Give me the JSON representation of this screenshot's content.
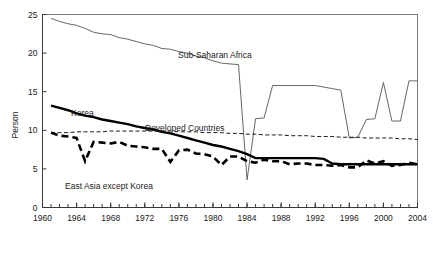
{
  "chart_data": {
    "type": "line",
    "title": "",
    "xlabel": "",
    "ylabel": "Person",
    "xlim": [
      1960,
      2004
    ],
    "ylim": [
      0,
      25
    ],
    "grid": false,
    "legend_position": "inline-annotations",
    "x_tick_labels": [
      "1960",
      "1964",
      "1968",
      "1972",
      "1976",
      "1980",
      "1984",
      "1988",
      "1992",
      "1996",
      "2000",
      "2004"
    ],
    "x_tick_values": [
      1960,
      1964,
      1968,
      1972,
      1976,
      1980,
      1984,
      1988,
      1992,
      1996,
      2000,
      2004
    ],
    "x_minor_tick_step": 1,
    "y_tick_labels": [
      "0",
      "5",
      "10",
      "15",
      "20",
      "25"
    ],
    "y_tick_values": [
      0,
      5,
      10,
      15,
      20,
      25
    ],
    "x": [
      1961,
      1962,
      1963,
      1964,
      1965,
      1966,
      1967,
      1968,
      1969,
      1970,
      1971,
      1972,
      1973,
      1974,
      1975,
      1976,
      1977,
      1978,
      1979,
      1980,
      1981,
      1982,
      1983,
      1984,
      1985,
      1986,
      1987,
      1988,
      1989,
      1990,
      1991,
      1992,
      1993,
      1994,
      1995,
      1996,
      1997,
      1998,
      1999,
      2000,
      2001,
      2002,
      2003,
      2004
    ],
    "series": [
      {
        "name": "Sub-Saharan Africa",
        "style": "thin-solid",
        "color": "#555555",
        "annotation": "Sub-Saharan Africa",
        "values": [
          24.5,
          24.1,
          23.8,
          23.6,
          23.2,
          22.7,
          22.5,
          22.4,
          22.0,
          21.8,
          21.5,
          21.2,
          21.0,
          20.6,
          20.5,
          20.2,
          20.0,
          19.6,
          19.4,
          19.0,
          18.7,
          18.6,
          18.5,
          3.6,
          11.5,
          11.6,
          15.8,
          15.8,
          15.8,
          15.8,
          15.8,
          15.8,
          15.6,
          15.4,
          15.2,
          9.0,
          9.1,
          11.4,
          11.5,
          16.2,
          11.2,
          11.2,
          16.4,
          16.4
        ]
      },
      {
        "name": "Korea",
        "style": "thick-solid",
        "color": "#000000",
        "annotation": "Korea",
        "values": [
          13.2,
          12.9,
          12.6,
          12.2,
          11.9,
          11.7,
          11.4,
          11.2,
          11.0,
          10.8,
          10.5,
          10.3,
          10.1,
          9.8,
          9.6,
          9.3,
          9.0,
          8.7,
          8.4,
          8.1,
          7.9,
          7.6,
          7.3,
          6.9,
          6.4,
          6.4,
          6.4,
          6.4,
          6.4,
          6.4,
          6.4,
          6.4,
          6.3,
          5.7,
          5.6,
          5.6,
          5.6,
          5.6,
          5.6,
          5.6,
          5.6,
          5.6,
          5.6,
          5.6
        ]
      },
      {
        "name": "Developed Countries",
        "style": "thin-dashed",
        "color": "#1a1a1a",
        "annotation": "Developed Countries",
        "values": [
          9.7,
          9.7,
          9.7,
          9.8,
          9.8,
          9.8,
          9.8,
          9.9,
          9.9,
          9.9,
          9.9,
          9.9,
          9.9,
          9.9,
          9.9,
          9.8,
          9.8,
          9.8,
          9.7,
          9.7,
          9.7,
          9.6,
          9.6,
          9.5,
          9.5,
          9.4,
          9.4,
          9.4,
          9.3,
          9.3,
          9.3,
          9.2,
          9.2,
          9.2,
          9.1,
          9.1,
          9.1,
          9.0,
          9.0,
          9.0,
          9.0,
          8.9,
          8.9,
          8.8
        ]
      },
      {
        "name": "East Asia except Korea",
        "style": "thick-dashed",
        "color": "#000000",
        "annotation": "East Asia except Korea",
        "values": [
          9.7,
          9.3,
          9.2,
          9.0,
          6.0,
          8.5,
          8.4,
          8.3,
          8.5,
          8.0,
          7.9,
          7.8,
          7.6,
          7.6,
          5.9,
          7.4,
          7.5,
          7.0,
          6.9,
          6.6,
          5.5,
          6.6,
          6.6,
          6.0,
          5.8,
          6.2,
          6.0,
          6.0,
          5.6,
          5.7,
          5.7,
          5.5,
          5.5,
          5.4,
          5.5,
          5.2,
          5.2,
          6.1,
          5.7,
          6.0,
          5.4,
          5.5,
          5.8,
          5.6
        ]
      }
    ]
  },
  "annotations": {
    "sub_saharan": {
      "text": "Sub-Saharan Africa",
      "x": 178,
      "y": 58
    },
    "korea": {
      "text": "Korea",
      "x": 71,
      "y": 116
    },
    "developed": {
      "text": "Developed Countries",
      "x": 145,
      "y": 131
    },
    "east_asia": {
      "text": "East Asia except Korea",
      "x": 65,
      "y": 189
    }
  },
  "axes": {
    "y_axis_title": "Person"
  }
}
